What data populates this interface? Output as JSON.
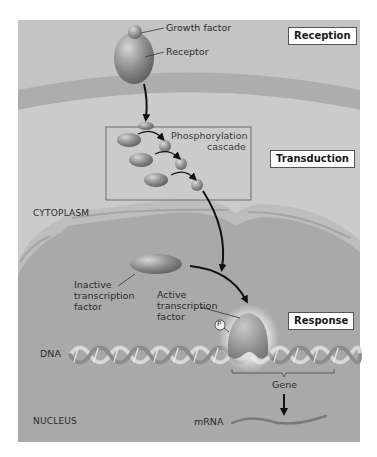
{
  "stages": {
    "reception": "Reception",
    "transduction": "Transduction",
    "response": "Response"
  },
  "labels": {
    "growth_factor": "Growth factor",
    "receptor": "Receptor",
    "phosphorylation_cascade_line1": "Phosphorylation",
    "phosphorylation_cascade_line2": "cascade",
    "cytoplasm": "CYTOPLASM",
    "inactive_tf_line1": "Inactive",
    "inactive_tf_line2": "transcription",
    "inactive_tf_line3": "factor",
    "active_tf_line1": "Active",
    "active_tf_line2": "transcription",
    "active_tf_line3": "factor",
    "phosphate": "P",
    "dna": "DNA",
    "gene": "Gene",
    "nucleus": "NUCLEUS",
    "mrna": "mRNA"
  },
  "colors": {
    "panel_background": "#c4c4c4",
    "cytoplasm": "#cbcbcb",
    "plasma_membrane": "#adadad",
    "nucleus": "#a9a9a9",
    "nuclear_envelope": "#bdbdbd",
    "protein": "#8a8a8a",
    "arrow": "#111111"
  }
}
